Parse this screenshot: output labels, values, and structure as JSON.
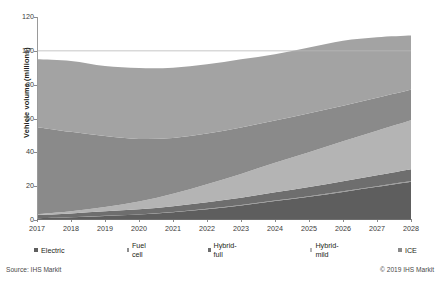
{
  "chart_data": {
    "type": "area",
    "stacked": true,
    "title": "",
    "xlabel": "",
    "ylabel": "Vehicle volume (millions)",
    "ylim": [
      0,
      120
    ],
    "yticks": [
      0,
      20,
      40,
      60,
      80,
      100,
      120
    ],
    "grid": "horizontal-gridline-at-100-only",
    "legend_position": "bottom",
    "categories": [
      "2017",
      "2018",
      "2019",
      "2020",
      "2021",
      "2022",
      "2023",
      "2024",
      "2025",
      "2026",
      "2027",
      "2028"
    ],
    "series": [
      {
        "name": "Electric",
        "color": "#5e5e5e",
        "values": [
          1.0,
          1.6,
          2.4,
          3.2,
          4.6,
          6.4,
          8.6,
          11.2,
          13.8,
          16.6,
          19.6,
          22.6
        ]
      },
      {
        "name": "Fuel cell",
        "color": "#8f8f8f",
        "values": [
          0.0,
          0.0,
          0.1,
          0.1,
          0.1,
          0.2,
          0.2,
          0.3,
          0.3,
          0.4,
          0.4,
          0.5
        ]
      },
      {
        "name": "Hybrid-full",
        "color": "#6e6e6e",
        "values": [
          2.0,
          2.3,
          2.6,
          3.0,
          3.4,
          3.9,
          4.4,
          4.9,
          5.4,
          5.9,
          6.4,
          6.9
        ]
      },
      {
        "name": "Hybrid-mild",
        "color": "#b4b4b4",
        "values": [
          0.4,
          1.2,
          2.6,
          4.6,
          7.4,
          10.6,
          14.0,
          17.4,
          20.6,
          23.6,
          26.4,
          29.0
        ]
      },
      {
        "name": "ICE",
        "color": "#8a8a8a",
        "values": [
          51.5,
          47.0,
          42.0,
          37.0,
          33.0,
          30.0,
          27.5,
          25.0,
          23.0,
          21.0,
          19.5,
          18.0
        ]
      },
      {
        "name": "ICE: Stop/start",
        "color": "#a3a3a3",
        "values": [
          40.1,
          41.9,
          41.3,
          41.9,
          41.5,
          40.9,
          40.3,
          39.2,
          38.9,
          38.5,
          35.7,
          32.0
        ]
      }
    ],
    "totals": [
      95.0,
      94.0,
      91.0,
      89.8,
      90.0,
      92.0,
      95.0,
      98.0,
      102.0,
      106.0,
      108.0,
      109.0
    ]
  },
  "legend": {
    "items": [
      {
        "label": "Electric"
      },
      {
        "label": "Fuel cell"
      },
      {
        "label": "Hybrid-full"
      },
      {
        "label": "Hybrid-mild"
      },
      {
        "label": "ICE"
      },
      {
        "label": "ICE: Stop/start"
      }
    ]
  },
  "footer": {
    "source": "Source: IHS Markit",
    "copyright": "© 2019 IHS Markit"
  }
}
